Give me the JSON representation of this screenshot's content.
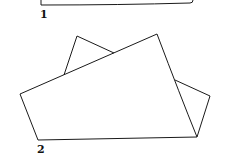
{
  "figure": {
    "panels": [
      {
        "label": "1",
        "description": "Top shape (partially cropped) – rectangle bottom edge"
      },
      {
        "label": "2",
        "description": "Two overlapping quadrilateral sheets"
      }
    ]
  },
  "colors": {
    "stroke": "#1a1a1a",
    "background": "#ffffff"
  }
}
